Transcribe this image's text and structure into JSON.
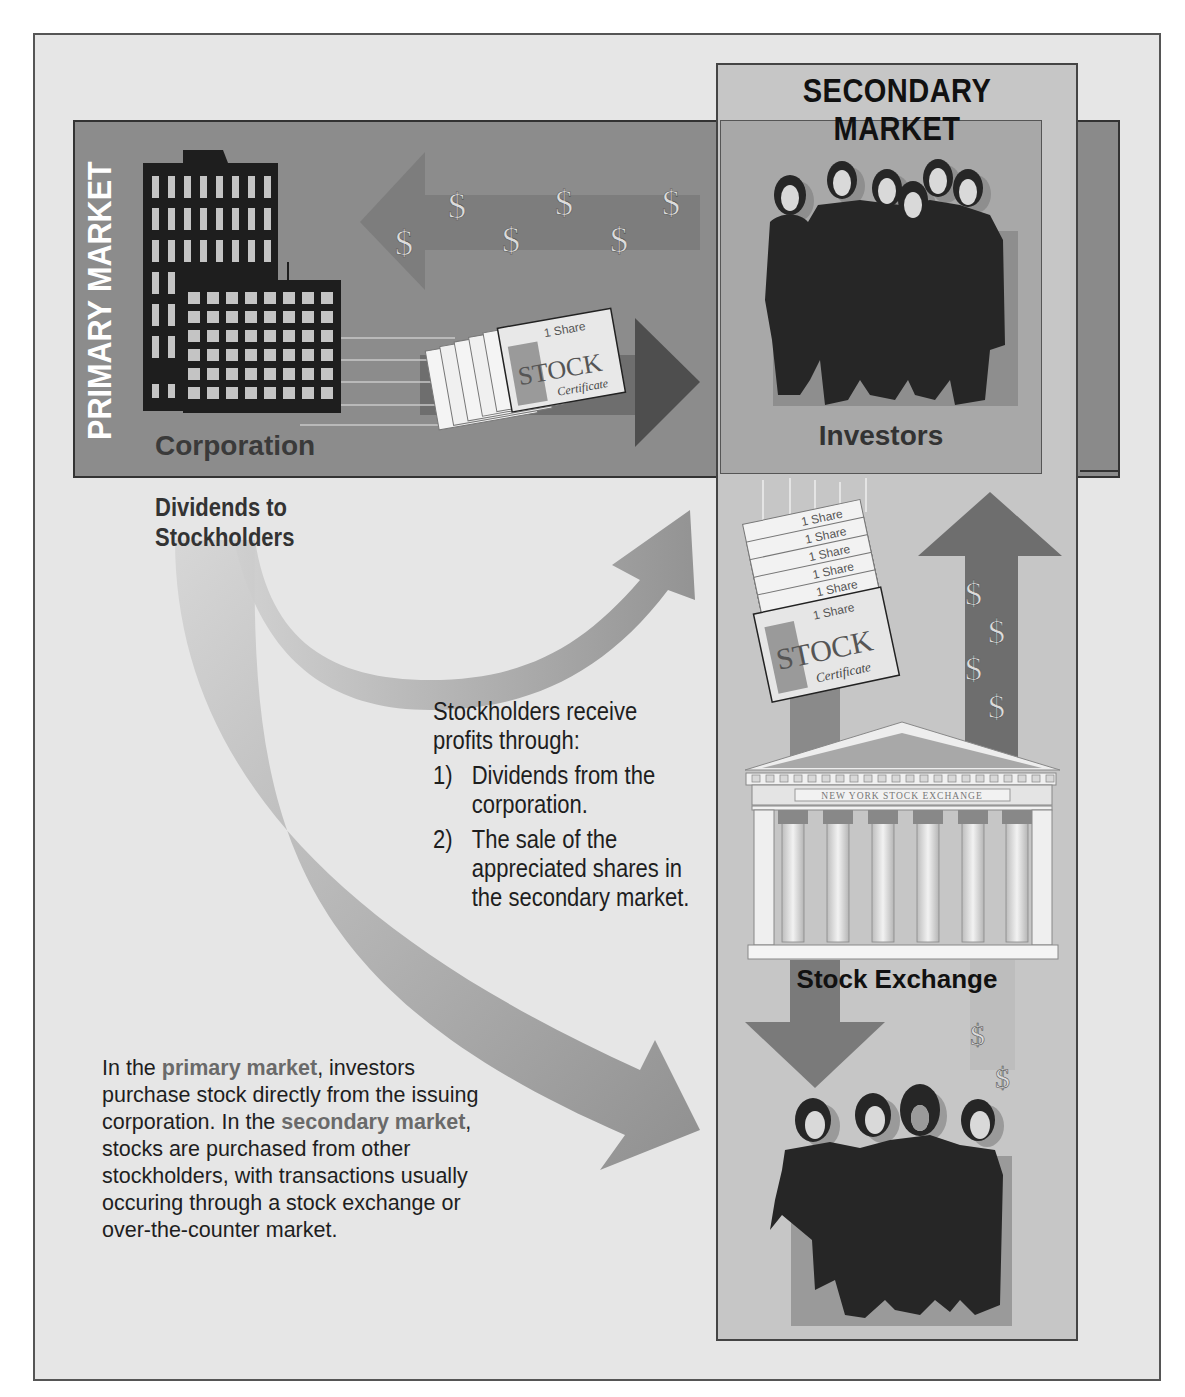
{
  "figure": {
    "label": "FIGURE"
  },
  "primary_market": {
    "title": "PRIMARY MARKET",
    "corporation_label": "Corporation",
    "certificate": {
      "share_text": "1 Share",
      "stock_text": "STOCK",
      "certificate_text": "Certificate"
    },
    "dollar_symbols": [
      "$",
      "$",
      "$",
      "$",
      "$",
      "$"
    ]
  },
  "secondary_market": {
    "title": "SECONDARY MARKET",
    "investors_label": "Investors",
    "stock_exchange_label": "Stock Exchange",
    "exchange_building_text": "NEW YORK STOCK EXCHANGE",
    "certificate_stack": [
      "1 Share",
      "1 Share",
      "1 Share",
      "1 Share",
      "1 Share",
      "1 Share"
    ],
    "certificate": {
      "stock_text": "STOCK",
      "certificate_text": "Certificate"
    },
    "up_arrow_dollars": [
      "$",
      "$",
      "$",
      "$"
    ],
    "falling_dollars": [
      "$",
      "$"
    ]
  },
  "dividends": {
    "label_line1": "Dividends to",
    "label_line2": "Stockholders"
  },
  "profits_note": {
    "intro_line1": "Stockholders receive",
    "intro_line2": "profits through:",
    "items": [
      {
        "num": "1)",
        "text": "Dividends from the corporation."
      },
      {
        "num": "2)",
        "text": "The sale of the appreciated shares in the secondary market."
      }
    ]
  },
  "explanation": {
    "part1": "In the ",
    "term1": "primary market",
    "part2": ", investors purchase stock directly from the issuing corporation. In the ",
    "term2": "secondary market",
    "part3": ", stocks are purchased from other stockholders, with transactions usually occuring through a stock exchange or over-the-counter market."
  },
  "colors": {
    "frame_bg": "#e6e6e6",
    "primary_band": "#8c8c8c",
    "secondary_panel": "#c6c6c6",
    "investors_box": "#a8a8a8",
    "arrow_dark": "#6e6e6e",
    "arrow_light": "#b0b0b0",
    "emphasis_text": "#6a6a6a"
  }
}
